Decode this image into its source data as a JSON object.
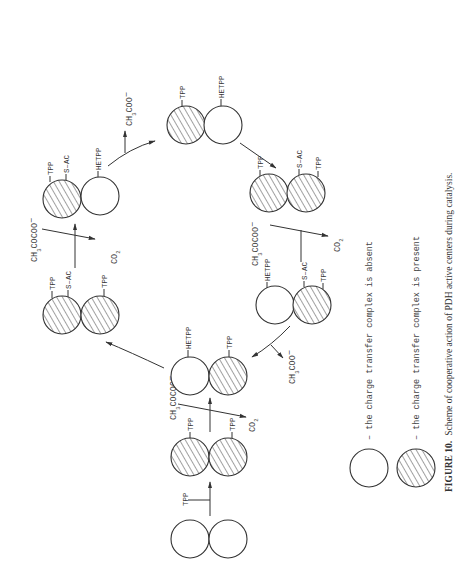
{
  "figure": {
    "number_label": "FIGURE 10.",
    "caption": "Scheme of cooperative action of PDH active centers during catalysis.",
    "orientation": "rotated 90 degrees counter-clockwise"
  },
  "labels": {
    "tpp": "TPP",
    "hetpp": "HETPP",
    "sac": "S–AC",
    "pyruvate_main": "CH",
    "pyruvate_sub": "3",
    "pyruvate_tail": "COCOO",
    "minus": "−",
    "acetate_tail": "COO",
    "co2_main": "CO",
    "co2_sub": "2"
  },
  "legend": [
    {
      "symbol": "open-circle",
      "text": "–  the charge transfer complex is absent"
    },
    {
      "symbol": "hatched-circle",
      "text": "–  the charge transfer complex is present"
    }
  ],
  "states": [
    {
      "id": "H",
      "left": "open",
      "right": "open",
      "labels": []
    },
    {
      "id": "G",
      "left": "hatched",
      "right": "hatched",
      "labels": [
        "TPP",
        "TPP"
      ]
    },
    {
      "id": "F",
      "left": "open",
      "right": "hatched",
      "labels": [
        "HETPP",
        "TPP"
      ]
    },
    {
      "id": "E",
      "left": "hatched",
      "right": "hatched",
      "labels": [
        "TPP",
        "S-AC",
        "TPP"
      ]
    },
    {
      "id": "A",
      "left": "hatched",
      "right": "open",
      "labels": [
        "TPP",
        "S-AC",
        "HETPP"
      ]
    },
    {
      "id": "B",
      "left": "hatched",
      "right": "open",
      "labels": [
        "TPP",
        "HETPP"
      ]
    },
    {
      "id": "C",
      "left": "hatched",
      "right": "hatched",
      "labels": [
        "TPP",
        "S-AC",
        "TPP"
      ]
    },
    {
      "id": "D",
      "left": "open",
      "right": "hatched",
      "labels": [
        "HETPP",
        "S-AC",
        "TPP"
      ]
    }
  ],
  "transitions": [
    {
      "from": "H",
      "to": "G",
      "input": "TPP"
    },
    {
      "from": "G",
      "to": "F",
      "input": "CH3COCOO-",
      "output": "CO2"
    },
    {
      "from": "F",
      "to": "E",
      "output": "none"
    },
    {
      "from": "E",
      "to": "A",
      "input": "CH3COCOO-",
      "output": "CO2"
    },
    {
      "from": "A",
      "to": "B",
      "output": "CH3COO-"
    },
    {
      "from": "B",
      "to": "C",
      "output": "none"
    },
    {
      "from": "C",
      "to": "D",
      "input": "CH3COCOO-",
      "output": "CO2"
    },
    {
      "from": "D",
      "to": "F",
      "output": "CH3COO-"
    }
  ]
}
